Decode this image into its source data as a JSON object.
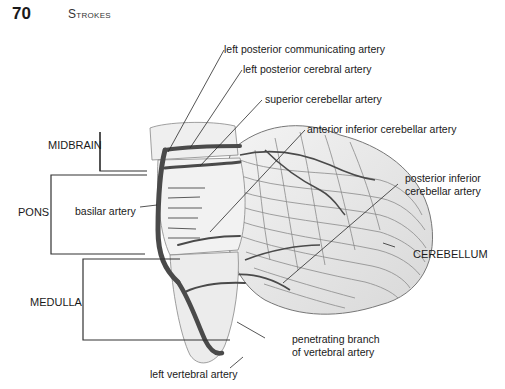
{
  "header": {
    "page_number": "70",
    "running_head": "Strokes"
  },
  "regions": {
    "midbrain": "MIDBRAIN",
    "pons": "PONS",
    "medulla": "MEDULLA",
    "cerebellum": "CEREBELLUM"
  },
  "labels": {
    "left_posterior_communicating_artery": "left posterior communicating artery",
    "left_posterior_cerebral_artery": "left posterior cerebral artery",
    "superior_cerebellar_artery": "superior cerebellar artery",
    "anterior_inferior_cerebellar_artery": "anterior inferior cerebellar artery",
    "posterior_inferior_cerebellar_artery_line1": "posterior inferior",
    "posterior_inferior_cerebellar_artery_line2": "cerebellar artery",
    "basilar_artery": "basilar artery",
    "penetrating_branch_line1": "penetrating branch",
    "penetrating_branch_line2": "of vertebral artery",
    "left_vertebral_artery": "left vertebral artery"
  },
  "colors": {
    "artery": "#4a4a4a",
    "tissue": "#e6e6e6",
    "folia": "#8a8a8a",
    "leader": "#2a2a2a"
  }
}
